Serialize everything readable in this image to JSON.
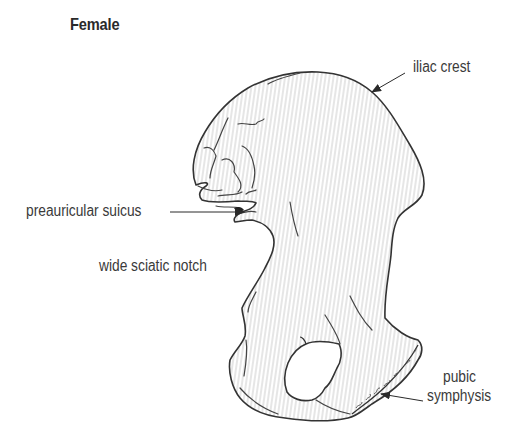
{
  "figure": {
    "title": "Female",
    "colors": {
      "outline": "#3a3a3a",
      "hatch": "#d9d9d9",
      "background": "#ffffff",
      "text": "#3a3a3a"
    }
  },
  "labels": {
    "iliac_crest": "iliac crest",
    "preauricular_sulcus": "preauricular suicus",
    "sciatic_notch": "wide sciatic notch",
    "pubic_line1": "pubic",
    "pubic_line2": "symphysis"
  },
  "icons": {
    "arrow": "arrowhead-pointer"
  }
}
